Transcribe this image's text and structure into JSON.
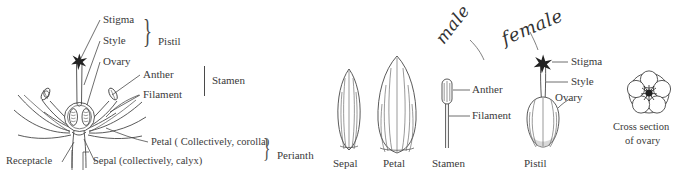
{
  "figure": {
    "background": "#ffffff",
    "ink_color": "#3c3c3c"
  },
  "left_diagram": {
    "name": "longitudinal-section-of-flower",
    "labels": {
      "stigma": "Stigma",
      "style": "Style",
      "ovary": "Ovary",
      "anther": "Anther",
      "filament": "Filament",
      "petal": "Petal ( Collectively, corolla)",
      "sepal": "Sepal (collectively, calyx)",
      "receptacle": "Receptacle"
    },
    "groups": {
      "pistil": "Pistil",
      "stamen": "Stamen",
      "perianth": "Perianth"
    }
  },
  "right_diagram": {
    "name": "individual-floral-organs",
    "parts": [
      {
        "key": "sepal",
        "label": "Sepal"
      },
      {
        "key": "petal",
        "label": "Petal"
      },
      {
        "key": "stamen",
        "label": "Stamen"
      },
      {
        "key": "pistil",
        "label": "Pistil"
      }
    ],
    "stamen_labels": {
      "anther": "Anther",
      "filament": "Filament"
    },
    "pistil_labels": {
      "stigma": "Stigma",
      "style": "Style",
      "ovary": "Ovary"
    },
    "annotations": {
      "male": "male",
      "female": "female"
    },
    "cross_section": {
      "line1": "Cross section",
      "line2": "of ovary"
    }
  }
}
